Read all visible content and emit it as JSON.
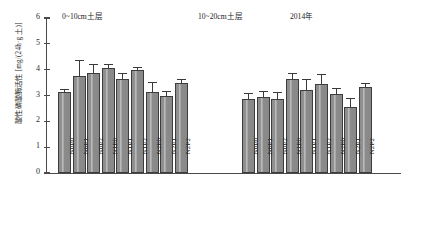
{
  "chart_data": {
    "type": "bar",
    "title": "",
    "xlabel": "",
    "ylabel": "酸性磷酸酶活性 [mg/(24h·g 土)]",
    "ylim": [
      0,
      6
    ],
    "yticks": [
      0,
      1,
      2,
      3,
      4,
      5,
      6
    ],
    "grid": false,
    "legend": null,
    "annotations": {
      "panel_left": "0~10cm土层",
      "panel_right": "10~20cm土层",
      "year": "2014年"
    },
    "categories": [
      "N0P0",
      "N0P1",
      "N0P2",
      "N1P0",
      "N1P1",
      "N1P2",
      "N2P0",
      "N2P1",
      "N2P2"
    ],
    "panels": [
      {
        "name": "0~10cm土层",
        "categories": [
          "N0P0",
          "N0P1",
          "N0P2",
          "N1P0",
          "N1P1",
          "N1P2",
          "N2P0",
          "N2P1",
          "N2P2"
        ],
        "values": [
          3.15,
          3.75,
          3.88,
          4.05,
          3.62,
          3.98,
          3.15,
          2.98,
          3.5
        ],
        "errors": [
          0.08,
          0.58,
          0.3,
          0.12,
          0.22,
          0.1,
          0.35,
          0.15,
          0.1
        ]
      },
      {
        "name": "10~20cm土层",
        "categories": [
          "N0P0",
          "N0P1",
          "N0P2",
          "N1P0",
          "N1P1",
          "N1P2",
          "N2P0",
          "N2P1",
          "N2P2"
        ],
        "values": [
          2.88,
          2.95,
          2.88,
          3.62,
          3.2,
          3.45,
          3.05,
          2.55,
          3.32
        ],
        "errors": [
          0.18,
          0.2,
          0.2,
          0.22,
          0.4,
          0.35,
          0.2,
          0.32,
          0.12
        ]
      }
    ]
  }
}
